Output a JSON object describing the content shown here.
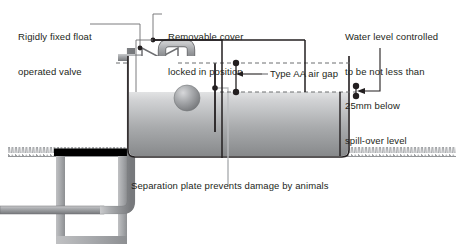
{
  "labels": {
    "float_valve": "Rigidly fixed float\noperated valve",
    "float_valve_line1": "Rigidly fixed float",
    "float_valve_line2": "operated valve",
    "removable_cover_line1": "Removable cover",
    "removable_cover_line2": "locked in position",
    "air_gap": "Type AA air gap",
    "water_level_line1": "Water level controlled",
    "water_level_line2": "to be not less than",
    "water_level_line3": "25mm below",
    "water_level_line4": "spill-over level",
    "separation_plate": "Separation plate prevents damage by animals"
  },
  "colors": {
    "text": "#231f20",
    "leader_line": "#6d6e71",
    "dimension_line": "#231f20",
    "pipe_stroke": "#808285",
    "pipe_fill": "#a7a9ac",
    "tank_outline": "#231f20",
    "tank_air_fill": "#ffffff",
    "water_top": "#d9dadb",
    "water_bottom": "#8a8c8e",
    "cover_plate": "#000000",
    "chamber_wall": "#a7a9ac",
    "ground_hatch": "#939598",
    "float_ball": "#a7a9ac",
    "dot": "#231f20",
    "dashed_level": "#6d6e71"
  },
  "geometry": {
    "canvas_width": 459,
    "canvas_height": 244,
    "tank": {
      "x": 128,
      "y": 56,
      "width": 221,
      "height": 101
    },
    "water_surface_y": 92,
    "ground_line_y": 156,
    "spill_over_level_y": 63,
    "air_gap_top_y": 63,
    "air_gap_bottom_y": 92,
    "chamber": {
      "x": 56,
      "y": 148,
      "width": 110,
      "height": 96
    }
  },
  "annotations": {
    "dimension_dots": 8,
    "air_gap_arrow_direction": "left",
    "water_level_arrow_direction": "left"
  }
}
